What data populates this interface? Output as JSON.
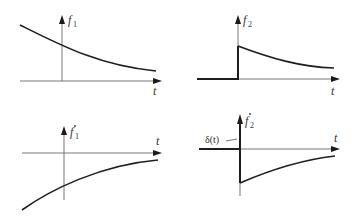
{
  "panels": [
    {
      "id": "f1",
      "y_label": "f",
      "y_sub": "1",
      "x_label": "t",
      "dotted": false,
      "description": "decaying exponential, positive"
    },
    {
      "id": "f2",
      "y_label": "f",
      "y_sub": "2",
      "x_label": "t",
      "dotted": false,
      "description": "step then decaying exponential"
    },
    {
      "id": "f1dot",
      "y_label": "f",
      "y_sub": "1",
      "x_label": "t",
      "dotted": true,
      "description": "negative rising toward zero"
    },
    {
      "id": "f2dot",
      "y_label": "f",
      "y_sub": "2",
      "x_label": "t",
      "dotted": true,
      "impulse_label": "δ(t)",
      "description": "impulse at origin then negative jump rising to zero"
    }
  ]
}
